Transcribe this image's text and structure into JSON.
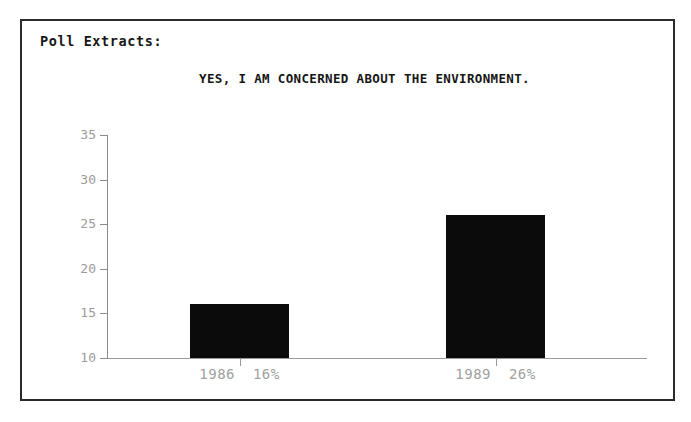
{
  "header": {
    "label": "Poll Extracts:"
  },
  "chart_data": {
    "type": "bar",
    "title": "YES, I AM CONCERNED ABOUT THE ENVIRONMENT.",
    "xlabel": "",
    "ylabel": "",
    "categories": [
      "1986",
      "1989"
    ],
    "values": [
      16,
      26
    ],
    "point_labels": [
      "1986  16%",
      "1989  26%"
    ],
    "value_labels": [
      "16%",
      "26%"
    ],
    "ylim": [
      10,
      35
    ],
    "yticks": [
      35,
      30,
      25,
      20,
      15,
      10
    ],
    "ytick_labels": [
      "35",
      "30",
      "25",
      "20",
      "15",
      "10"
    ],
    "grid": false,
    "legend": false,
    "bar_color": "#0b0b0b",
    "axis_color": "#9a9a9a",
    "tick_label_color": "#a0a0a0"
  },
  "colors": {
    "frame_border": "#2b2b2b",
    "background": "#ffffff",
    "title_text": "#161616"
  }
}
